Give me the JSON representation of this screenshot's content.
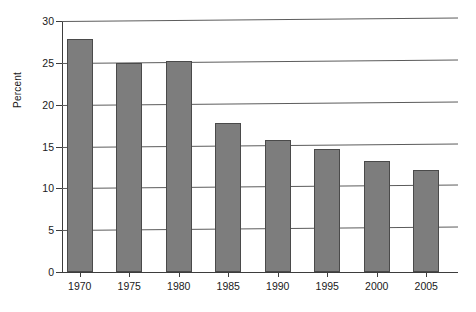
{
  "chart_data": {
    "type": "bar",
    "title": "",
    "subtitle": "",
    "xlabel": "",
    "ylabel": "Percent",
    "categories": [
      "1970",
      "1975",
      "1980",
      "1985",
      "1990",
      "1995",
      "2000",
      "2005"
    ],
    "values": [
      27.9,
      25.0,
      25.2,
      17.8,
      15.8,
      14.7,
      13.3,
      12.2
    ],
    "ylim": [
      0,
      30
    ],
    "ytick_labels": [
      "0",
      "5",
      "10",
      "15",
      "20",
      "25",
      "30"
    ],
    "ytick_values": [
      0,
      5,
      10,
      15,
      20,
      25,
      30
    ],
    "grid": true,
    "legend": false,
    "legend_position": "none",
    "bar_color": "#7d7d7d",
    "bar_edge_color": "#4a4a4a",
    "grid_color": "#5c5c5c",
    "axis_color": "#3d3d3d",
    "background_color": "#ffffff",
    "text_color": "#1a1a1a"
  }
}
